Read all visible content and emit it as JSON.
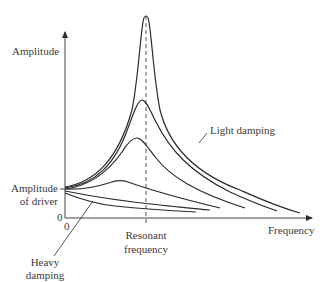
{
  "diagram": {
    "title": "",
    "labels": {
      "y_axis": "Amplitude",
      "x_axis": "Frequency",
      "amplitude_of_driver_line1": "Amplitude",
      "amplitude_of_driver_line2": "of driver",
      "y_origin": "0",
      "x_origin": "0",
      "resonant_line1": "Resonant",
      "resonant_line2": "frequency",
      "light_damping": "Light damping",
      "heavy_damping_line1": "Heavy",
      "heavy_damping_line2": "damping"
    },
    "colors": {
      "stroke": "#2a2a2a",
      "axis": "#444444",
      "text": "#3a3a3a",
      "background": "#ffffff"
    },
    "curves": [
      {
        "name": "light-damping-curve",
        "damping": "lightest",
        "peak": "sharp, highest at resonant frequency"
      },
      {
        "name": "damping-curve-2",
        "damping": "light-moderate",
        "peak": "high"
      },
      {
        "name": "damping-curve-3",
        "damping": "moderate",
        "peak": "medium"
      },
      {
        "name": "damping-curve-4",
        "damping": "heavier",
        "peak": "low, shifted left"
      },
      {
        "name": "damping-curve-5",
        "damping": "heavy",
        "peak": "none, decreasing"
      },
      {
        "name": "heavy-damping-curve",
        "damping": "heaviest",
        "peak": "none, decreasing fastest"
      }
    ]
  }
}
